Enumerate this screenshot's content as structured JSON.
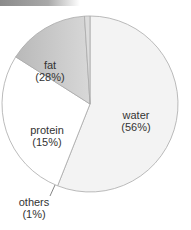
{
  "chart_data": {
    "type": "pie",
    "title": "",
    "categories": [
      "water",
      "fat",
      "protein",
      "others"
    ],
    "values": [
      56,
      28,
      15,
      1
    ],
    "labels": [
      "water (56%)",
      "fat (28%)",
      "protein (15%)",
      "others (1%)"
    ],
    "colors": [
      "#f3f3f3",
      "#ffffff",
      "#c4c4c4",
      "#dcdcdc"
    ],
    "start_angle_deg": 0,
    "direction": "clockwise",
    "legend": "none"
  },
  "labels": {
    "water": {
      "name": "water",
      "pct": "(56%)"
    },
    "fat": {
      "name": "fat",
      "pct": "(28%)"
    },
    "protein": {
      "name": "protein",
      "pct": "(15%)"
    },
    "others": {
      "name": "others",
      "pct": "(1%)"
    }
  }
}
